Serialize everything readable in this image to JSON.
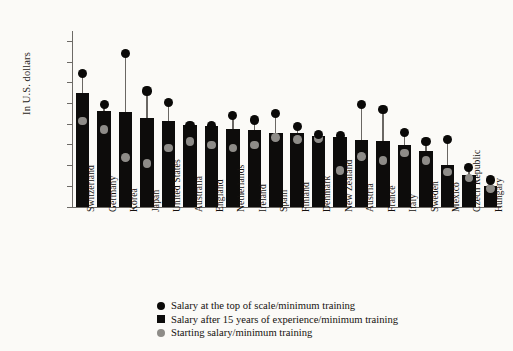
{
  "chart_data": {
    "type": "bar",
    "title": "",
    "xlabel": "",
    "ylabel": "In U.S. dollars",
    "ylim": [
      0,
      85000
    ],
    "ytick_values": [
      0,
      10000,
      20000,
      30000,
      40000,
      50000,
      60000,
      70000,
      80000
    ],
    "ytick_labels": [
      "0",
      "10,000",
      "20,000",
      "30,000",
      "40,000",
      "50,000",
      "60,000",
      "70,000",
      "80,000"
    ],
    "grid": false,
    "legend_position": "bottom-center",
    "categories": [
      "Switzerland",
      "Germany",
      "Korea",
      "Japan",
      "United States",
      "Australia",
      "England",
      "Netherlands",
      "Ireland",
      "Spain",
      "Finland",
      "Denmark",
      "New Zealand",
      "Austria",
      "France",
      "Italy",
      "Sweden",
      "Mexico",
      "Czech Republic",
      "Hungary"
    ],
    "series": [
      {
        "name": "Salary at the top of scale/minimum training",
        "marker": "circle-dark",
        "values": [
          64500,
          49500,
          74000,
          56000,
          50500,
          39500,
          39500,
          44000,
          42000,
          45000,
          39000,
          35000,
          34500,
          49500,
          47000,
          36000,
          31500,
          32500,
          19000,
          13000
        ]
      },
      {
        "name": "Salary after 15 years of experience/minimum training",
        "marker": "bar-dark",
        "values": [
          55000,
          46500,
          46000,
          43000,
          41500,
          39500,
          39000,
          37500,
          37000,
          35500,
          35500,
          34500,
          34000,
          32500,
          32000,
          30000,
          27000,
          20500,
          15500,
          10000
        ]
      },
      {
        "name": "Starting salary/minimum training",
        "marker": "circle-gray",
        "values": [
          41500,
          37500,
          24000,
          21000,
          28500,
          31500,
          30000,
          28500,
          30000,
          33500,
          32500,
          33000,
          17500,
          24500,
          22500,
          26000,
          22500,
          17000,
          14000,
          9000
        ]
      }
    ]
  },
  "legend": {
    "items": [
      {
        "label": "Salary at the top of scale/minimum training",
        "swatch": "circle-dark-icon"
      },
      {
        "label": "Salary after 15 years of experience/minimum training",
        "swatch": "square-dark-icon"
      },
      {
        "label": "Starting salary/minimum training",
        "swatch": "circle-gray-icon"
      }
    ]
  },
  "colors": {
    "bar": "#0d0c0b",
    "top_dot": "#0a0908",
    "start_dot": "#8e8c88",
    "axis": "#6d6a66",
    "background": "#fbfaf7",
    "text": "#15110e"
  }
}
